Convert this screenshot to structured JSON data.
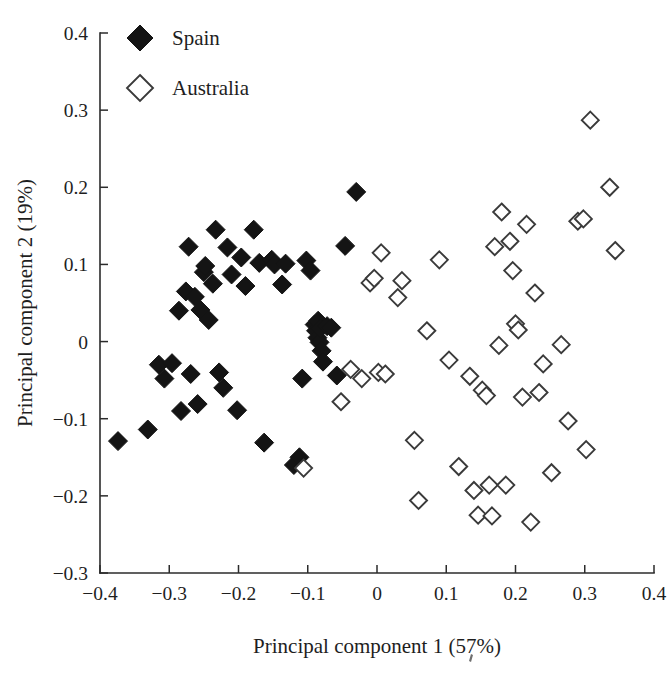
{
  "chart_data": {
    "type": "scatter",
    "title": "",
    "xlabel": "Principal component 1 (57%)",
    "ylabel": "Principal component 2 (19%)",
    "xlim": [
      -0.4,
      0.4
    ],
    "ylim": [
      -0.3,
      0.4
    ],
    "xticks": [
      -0.4,
      -0.3,
      -0.2,
      -0.1,
      0,
      0.1,
      0.2,
      0.3,
      0.4
    ],
    "xticklabels": [
      "−0.4",
      "−0.3",
      "−0.2",
      "−0.1",
      "0",
      "0.1",
      "0.2",
      "0.3",
      "0.4"
    ],
    "yticks": [
      -0.3,
      -0.2,
      -0.1,
      0,
      0.1,
      0.2,
      0.3,
      0.4
    ],
    "yticklabels": [
      "−0.3",
      "−0.2",
      "−0.1",
      "0",
      "0.1",
      "0.2",
      "0.3",
      "0.4"
    ],
    "grid": false,
    "legend_position": "top-left",
    "series": [
      {
        "name": "Spain",
        "marker": "filled-diamond",
        "color": "#141414",
        "points": [
          [
            -0.374,
            -0.129
          ],
          [
            -0.331,
            -0.114
          ],
          [
            -0.315,
            -0.03
          ],
          [
            -0.307,
            -0.048
          ],
          [
            -0.296,
            -0.028
          ],
          [
            -0.286,
            0.04
          ],
          [
            -0.283,
            -0.09
          ],
          [
            -0.276,
            0.065
          ],
          [
            -0.272,
            0.123
          ],
          [
            -0.269,
            -0.042
          ],
          [
            -0.263,
            0.058
          ],
          [
            -0.259,
            -0.081
          ],
          [
            -0.255,
            0.041
          ],
          [
            -0.25,
            0.09
          ],
          [
            -0.248,
            0.098
          ],
          [
            -0.243,
            0.028
          ],
          [
            -0.237,
            0.075
          ],
          [
            -0.233,
            0.145
          ],
          [
            -0.228,
            -0.04
          ],
          [
            -0.222,
            -0.06
          ],
          [
            -0.216,
            0.122
          ],
          [
            -0.21,
            0.087
          ],
          [
            -0.202,
            -0.089
          ],
          [
            -0.196,
            0.109
          ],
          [
            -0.19,
            0.072
          ],
          [
            -0.178,
            0.145
          ],
          [
            -0.17,
            0.102
          ],
          [
            -0.163,
            -0.131
          ],
          [
            -0.152,
            0.106
          ],
          [
            -0.148,
            0.1
          ],
          [
            -0.137,
            0.074
          ],
          [
            -0.132,
            0.101
          ],
          [
            -0.12,
            -0.16
          ],
          [
            -0.112,
            -0.15
          ],
          [
            -0.108,
            -0.048
          ],
          [
            -0.102,
            0.105
          ],
          [
            -0.096,
            0.092
          ],
          [
            -0.09,
            0.022
          ],
          [
            -0.088,
            0.014
          ],
          [
            -0.086,
            0.005
          ],
          [
            -0.085,
            0.027
          ],
          [
            -0.083,
            -0.001
          ],
          [
            -0.082,
            0.017
          ],
          [
            -0.08,
            -0.012
          ],
          [
            -0.078,
            -0.026
          ],
          [
            -0.072,
            0.02
          ],
          [
            -0.066,
            0.018
          ],
          [
            -0.058,
            -0.044
          ],
          [
            -0.046,
            0.124
          ],
          [
            -0.03,
            0.194
          ]
        ]
      },
      {
        "name": "Australia",
        "marker": "open-diamond",
        "color": "#3a3a3a",
        "points": [
          [
            -0.106,
            -0.164
          ],
          [
            -0.052,
            -0.078
          ],
          [
            -0.038,
            -0.036
          ],
          [
            -0.022,
            -0.048
          ],
          [
            -0.01,
            0.076
          ],
          [
            -0.004,
            0.082
          ],
          [
            0.002,
            -0.04
          ],
          [
            0.006,
            0.115
          ],
          [
            0.012,
            -0.042
          ],
          [
            0.03,
            0.057
          ],
          [
            0.036,
            0.079
          ],
          [
            0.054,
            -0.128
          ],
          [
            0.06,
            -0.206
          ],
          [
            0.072,
            0.014
          ],
          [
            0.09,
            0.106
          ],
          [
            0.104,
            -0.024
          ],
          [
            0.118,
            -0.162
          ],
          [
            0.134,
            -0.045
          ],
          [
            0.14,
            -0.193
          ],
          [
            0.146,
            -0.225
          ],
          [
            0.152,
            -0.063
          ],
          [
            0.158,
            -0.07
          ],
          [
            0.162,
            -0.186
          ],
          [
            0.166,
            -0.226
          ],
          [
            0.17,
            0.123
          ],
          [
            0.176,
            -0.005
          ],
          [
            0.18,
            0.168
          ],
          [
            0.186,
            -0.186
          ],
          [
            0.192,
            0.13
          ],
          [
            0.196,
            0.092
          ],
          [
            0.2,
            0.023
          ],
          [
            0.204,
            0.015
          ],
          [
            0.21,
            -0.072
          ],
          [
            0.216,
            0.152
          ],
          [
            0.222,
            -0.234
          ],
          [
            0.228,
            0.063
          ],
          [
            0.234,
            -0.066
          ],
          [
            0.24,
            -0.029
          ],
          [
            0.252,
            -0.17
          ],
          [
            0.266,
            -0.004
          ],
          [
            0.276,
            -0.103
          ],
          [
            0.29,
            0.156
          ],
          [
            0.298,
            0.159
          ],
          [
            0.302,
            -0.14
          ],
          [
            0.308,
            0.287
          ],
          [
            0.336,
            0.2
          ],
          [
            0.344,
            0.118
          ]
        ]
      }
    ]
  },
  "legend": {
    "items": [
      {
        "label": "Spain",
        "marker": "filled-diamond"
      },
      {
        "label": "Australia",
        "marker": "open-diamond"
      }
    ]
  }
}
